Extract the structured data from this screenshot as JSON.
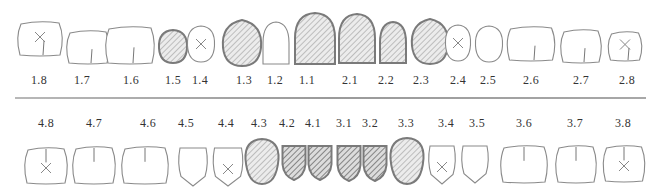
{
  "colors": {
    "outline": "#8a8a8a",
    "filled_outline": "#7a7a7a",
    "hatch_light": "#a9a9a9",
    "hatch_dark": "#6e6e6e",
    "divider": "#a0a0a0",
    "label": "#333333"
  },
  "legend_meaning": {
    "plain": "no marking",
    "cross": "X mark (missing/extracted)",
    "hatched": "hatched fill",
    "hatched_dark": "dense dark hatched fill"
  },
  "upper": {
    "teeth": [
      {
        "id": "1.8",
        "cx": 40,
        "w": 46,
        "h": 34,
        "y": 22,
        "shape": "molar",
        "mark": "cross",
        "fissure": true
      },
      {
        "id": "1.7",
        "cx": 88,
        "w": 44,
        "h": 33,
        "y": 31,
        "shape": "molar",
        "mark": "none",
        "fissure": true
      },
      {
        "id": "1.6",
        "cx": 130,
        "w": 50,
        "h": 37,
        "y": 27,
        "shape": "molar",
        "mark": "none",
        "fissure": true
      },
      {
        "id": "1.5",
        "cx": 173,
        "w": 28,
        "h": 33,
        "y": 30,
        "shape": "premolar",
        "mark": "hatched"
      },
      {
        "id": "1.4",
        "cx": 201,
        "w": 27,
        "h": 36,
        "y": 26,
        "shape": "premolar",
        "mark": "cross"
      },
      {
        "id": "1.3",
        "cx": 242,
        "w": 38,
        "h": 46,
        "y": 20,
        "shape": "canine",
        "mark": "hatched"
      },
      {
        "id": "1.2",
        "cx": 276,
        "w": 26,
        "h": 42,
        "y": 22,
        "shape": "incisor",
        "mark": "none"
      },
      {
        "id": "1.1",
        "cx": 315,
        "w": 40,
        "h": 51,
        "y": 13,
        "shape": "incisor",
        "mark": "hatched"
      },
      {
        "id": "2.1",
        "cx": 357,
        "w": 36,
        "h": 49,
        "y": 14,
        "shape": "incisor",
        "mark": "hatched"
      },
      {
        "id": "2.2",
        "cx": 393,
        "w": 26,
        "h": 41,
        "y": 22,
        "shape": "incisor",
        "mark": "hatched"
      },
      {
        "id": "2.3",
        "cx": 430,
        "w": 36,
        "h": 45,
        "y": 19,
        "shape": "canine",
        "mark": "hatched"
      },
      {
        "id": "2.4",
        "cx": 458,
        "w": 25,
        "h": 36,
        "y": 25,
        "shape": "premolar",
        "mark": "cross"
      },
      {
        "id": "2.5",
        "cx": 489,
        "w": 27,
        "h": 36,
        "y": 26,
        "shape": "premolar",
        "mark": "none"
      },
      {
        "id": "2.6",
        "cx": 531,
        "w": 49,
        "h": 34,
        "y": 27,
        "shape": "molar",
        "mark": "none",
        "fissure": true
      },
      {
        "id": "2.7",
        "cx": 581,
        "w": 42,
        "h": 33,
        "y": 30,
        "shape": "molar",
        "mark": "none",
        "fissure": true
      },
      {
        "id": "2.8",
        "cx": 625,
        "w": 35,
        "h": 29,
        "y": 32,
        "shape": "molar",
        "mark": "cross",
        "fissure": true
      }
    ],
    "label_y": 73
  },
  "lower": {
    "teeth": [
      {
        "id": "4.8",
        "cx": 46,
        "w": 44,
        "h": 36,
        "y": 148,
        "shape": "molar",
        "mark": "cross",
        "fissure": true
      },
      {
        "id": "4.7",
        "cx": 94,
        "w": 44,
        "h": 37,
        "y": 147,
        "shape": "molar",
        "mark": "none",
        "fissure": true
      },
      {
        "id": "4.6",
        "cx": 145,
        "w": 48,
        "h": 37,
        "y": 147,
        "shape": "molar",
        "mark": "none",
        "fissure": true
      },
      {
        "id": "4.5",
        "cx": 193,
        "w": 30,
        "h": 38,
        "y": 148,
        "shape": "lpremolar",
        "mark": "none"
      },
      {
        "id": "4.4",
        "cx": 228,
        "w": 31,
        "h": 38,
        "y": 148,
        "shape": "lpremolar",
        "mark": "cross"
      },
      {
        "id": "4.3",
        "cx": 262,
        "w": 33,
        "h": 45,
        "y": 139,
        "shape": "lcanine",
        "mark": "hatched"
      },
      {
        "id": "4.2",
        "cx": 294,
        "w": 23,
        "h": 35,
        "y": 145,
        "shape": "lincisor",
        "mark": "hatched_dark"
      },
      {
        "id": "4.1",
        "cx": 320,
        "w": 23,
        "h": 35,
        "y": 145,
        "shape": "lincisor",
        "mark": "hatched_dark"
      },
      {
        "id": "3.1",
        "cx": 349,
        "w": 23,
        "h": 36,
        "y": 145,
        "shape": "lincisor",
        "mark": "hatched_dark"
      },
      {
        "id": "3.2",
        "cx": 375,
        "w": 23,
        "h": 36,
        "y": 145,
        "shape": "lincisor",
        "mark": "hatched_dark"
      },
      {
        "id": "3.3",
        "cx": 407,
        "w": 33,
        "h": 46,
        "y": 138,
        "shape": "lcanine",
        "mark": "hatched"
      },
      {
        "id": "3.4",
        "cx": 442,
        "w": 28,
        "h": 38,
        "y": 146,
        "shape": "lpremolar",
        "mark": "cross"
      },
      {
        "id": "3.5",
        "cx": 475,
        "w": 28,
        "h": 37,
        "y": 146,
        "shape": "lpremolar",
        "mark": "none"
      },
      {
        "id": "3.6",
        "cx": 524,
        "w": 48,
        "h": 37,
        "y": 146,
        "shape": "molar",
        "mark": "none",
        "fissure": true
      },
      {
        "id": "3.7",
        "cx": 576,
        "w": 42,
        "h": 37,
        "y": 146,
        "shape": "molar",
        "mark": "none",
        "fissure": true
      },
      {
        "id": "3.8",
        "cx": 624,
        "w": 43,
        "h": 36,
        "y": 146,
        "shape": "molar",
        "mark": "cross",
        "fissure": true
      }
    ],
    "label_y": 116,
    "label_x": [
      46,
      94,
      148,
      186,
      226,
      259,
      287,
      313,
      344,
      370,
      406,
      446,
      477,
      524,
      575,
      623
    ]
  },
  "upper_label_x": [
    39,
    82,
    131,
    173,
    200,
    244,
    275,
    307,
    350,
    386,
    421,
    458,
    488,
    531,
    581,
    627
  ]
}
